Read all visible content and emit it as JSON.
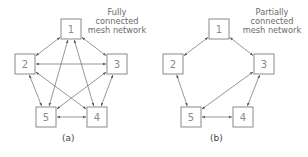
{
  "colors": {
    "node_stroke": "#8a8a8a",
    "node_text": "#8a8a8a",
    "edge": "#6a6a6a",
    "caption_text": "#6a6a6a"
  },
  "diagrams": [
    {
      "id": "a",
      "sublabel": "(a)",
      "caption_lines": [
        "Fully",
        "connected",
        "mesh network"
      ],
      "nodes": [
        {
          "label": "1",
          "x": 61,
          "y": 19
        },
        {
          "label": "2",
          "x": 15,
          "y": 54
        },
        {
          "label": "3",
          "x": 107,
          "y": 54
        },
        {
          "label": "4",
          "x": 87,
          "y": 107
        },
        {
          "label": "5",
          "x": 36,
          "y": 107
        }
      ],
      "edges": [
        [
          "1",
          "2"
        ],
        [
          "1",
          "3"
        ],
        [
          "1",
          "4"
        ],
        [
          "1",
          "5"
        ],
        [
          "2",
          "3"
        ],
        [
          "2",
          "4"
        ],
        [
          "2",
          "5"
        ],
        [
          "3",
          "4"
        ],
        [
          "3",
          "5"
        ],
        [
          "4",
          "5"
        ]
      ]
    },
    {
      "id": "b",
      "sublabel": "(b)",
      "caption_lines": [
        "Partially",
        "connected",
        "mesh network"
      ],
      "nodes": [
        {
          "label": "1",
          "x": 209,
          "y": 19
        },
        {
          "label": "2",
          "x": 163,
          "y": 54
        },
        {
          "label": "3",
          "x": 254,
          "y": 54
        },
        {
          "label": "4",
          "x": 233,
          "y": 107
        },
        {
          "label": "5",
          "x": 181,
          "y": 107
        }
      ],
      "edges": [
        [
          "1",
          "2"
        ],
        [
          "1",
          "3"
        ],
        [
          "2",
          "5"
        ],
        [
          "3",
          "5"
        ],
        [
          "3",
          "4"
        ],
        [
          "4",
          "5"
        ]
      ]
    }
  ]
}
